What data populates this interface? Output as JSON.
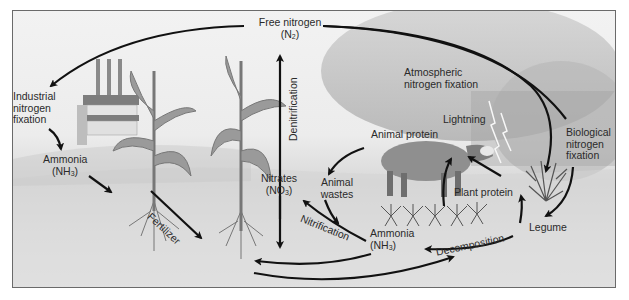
{
  "diagram": {
    "colors": {
      "arrow": "#111111",
      "text": "#2a2a2a",
      "frame": "#6a6a6a"
    },
    "labels": {
      "free_nitrogen": "Free nitrogen",
      "free_nitrogen_formula_pre": "(N",
      "free_nitrogen_formula_sub": "2",
      "free_nitrogen_formula_post": ")",
      "industrial_fixation_1": "Industrial",
      "industrial_fixation_2": "nitrogen",
      "industrial_fixation_3": "fixation",
      "ammonia_left": "Ammonia",
      "ammonia_left_formula_pre": "(NH",
      "ammonia_left_formula_sub": "3",
      "ammonia_left_formula_post": ")",
      "fertilizer": "Fertilizer",
      "denitrification": "Denitrification",
      "nitrates": "Nitrates",
      "nitrates_formula_pre": "(NO",
      "nitrates_formula_sub": "3",
      "nitrates_formula_post": ")",
      "atmospheric_fixation_1": "Atmospheric",
      "atmospheric_fixation_2": "nitrogen fixation",
      "lightning": "Lightning",
      "animal_protein": "Animal protein",
      "animal_wastes_1": "Animal",
      "animal_wastes_2": "wastes",
      "nitrification": "Nitrification",
      "ammonia_center": "Ammonia",
      "ammonia_center_formula_pre": "(NH",
      "ammonia_center_formula_sub": "3",
      "ammonia_center_formula_post": ")",
      "plant_protein": "Plant protein",
      "decomposition": "Decomposition",
      "biological_fixation_1": "Biological",
      "biological_fixation_2": "nitrogen",
      "biological_fixation_3": "fixation",
      "legume": "Legume"
    },
    "illustrations": [
      "factory",
      "corn-plant-left",
      "corn-plant-right",
      "storm-cloud",
      "lightning-bolt",
      "cow",
      "seedlings",
      "legume-bush"
    ]
  }
}
